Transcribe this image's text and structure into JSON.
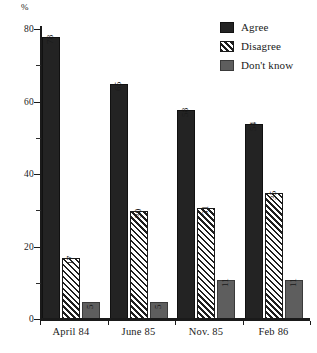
{
  "chart_data": {
    "type": "bar",
    "title": "",
    "xlabel": "",
    "ylabel": "%",
    "ylim": [
      0,
      80
    ],
    "grid": false,
    "legend_position": "top-right",
    "categories": [
      "April 84",
      "June 85",
      "Nov. 85",
      "Feb 86"
    ],
    "series": [
      {
        "name": "Agree",
        "values": [
          78,
          65,
          58,
          54
        ],
        "color": "#232323",
        "fill": "solid"
      },
      {
        "name": "Disagree",
        "values": [
          17,
          30,
          31,
          35
        ],
        "color": "#ffffff",
        "fill": "diagonal-hatch"
      },
      {
        "name": "Don't know",
        "values": [
          5,
          5,
          11,
          11
        ],
        "color": "#5e5e5e",
        "fill": "solid"
      }
    ],
    "y_ticks_major": [
      0,
      20,
      40,
      60,
      80
    ],
    "y_ticks_minor": [
      10,
      30,
      50,
      70
    ],
    "y_tick_labels": [
      "0",
      "20",
      "40",
      "60",
      "80"
    ],
    "data_labels_rotated": true
  },
  "axis": {
    "unit_label": "%"
  },
  "legend": {
    "items": [
      {
        "label": "Agree"
      },
      {
        "label": "Disagree"
      },
      {
        "label": "Don't know"
      }
    ]
  }
}
